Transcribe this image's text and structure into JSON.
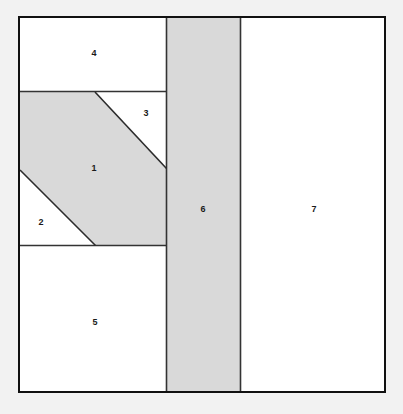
{
  "diagram": {
    "canvas": {
      "width": 403,
      "height": 414
    },
    "background_color": "#f2f2f2",
    "colors": {
      "shaded_fill": "#d9d9d9",
      "plain_fill": "#ffffff",
      "outer_border": "#111111",
      "inner_line": "#333333"
    },
    "outer_frame": {
      "x": 18,
      "y": 16,
      "width": 367,
      "height": 376
    },
    "regions": [
      {
        "id": "region-1",
        "label": "1",
        "shape": "hexagon",
        "filled": true,
        "fill": "#d9d9d9",
        "points": "20,92 95,92 166,168 166,245 95,245 20,170",
        "label_x": 94,
        "label_y": 168
      },
      {
        "id": "region-2",
        "label": "2",
        "shape": "triangle",
        "filled": false,
        "fill": "#ffffff",
        "points": "20,170 95,245 20,245",
        "label_x": 41,
        "label_y": 222
      },
      {
        "id": "region-3",
        "label": "3",
        "shape": "triangle",
        "filled": false,
        "fill": "#ffffff",
        "points": "95,92 166,92 166,168",
        "label_x": 146,
        "label_y": 113
      },
      {
        "id": "region-4",
        "label": "4",
        "shape": "rectangle",
        "filled": false,
        "fill": "#ffffff",
        "points": "20,17 166,17 166,91 20,91",
        "label_x": 94,
        "label_y": 53
      },
      {
        "id": "region-5",
        "label": "5",
        "shape": "rectangle",
        "filled": false,
        "fill": "#ffffff",
        "points": "20,246 166,246 166,391 20,391",
        "label_x": 95,
        "label_y": 322
      },
      {
        "id": "region-6",
        "label": "6",
        "shape": "rectangle",
        "filled": true,
        "fill": "#d9d9d9",
        "points": "167,17 240,17 240,391 167,391",
        "label_x": 203,
        "label_y": 209
      },
      {
        "id": "region-7",
        "label": "7",
        "shape": "rectangle",
        "filled": false,
        "fill": "#ffffff",
        "points": "241,17 384,17 384,391 241,391",
        "label_x": 314,
        "label_y": 209
      }
    ],
    "edges": [
      {
        "id": "edge-top-of-1",
        "x1": 20,
        "y1": 91.5,
        "x2": 166,
        "y2": 91.5
      },
      {
        "id": "edge-bottom-of-1",
        "x1": 20,
        "y1": 245.5,
        "x2": 166,
        "y2": 245.5
      },
      {
        "id": "edge-right-column-1",
        "x1": 166.5,
        "y1": 17,
        "x2": 166.5,
        "y2": 391
      },
      {
        "id": "edge-band-right",
        "x1": 240.5,
        "y1": 17,
        "x2": 240.5,
        "y2": 391
      },
      {
        "id": "edge-diagonal-upper",
        "x1": 95,
        "y1": 92,
        "x2": 166,
        "y2": 168
      },
      {
        "id": "edge-diagonal-lower",
        "x1": 20,
        "y1": 170,
        "x2": 95,
        "y2": 245
      }
    ]
  }
}
